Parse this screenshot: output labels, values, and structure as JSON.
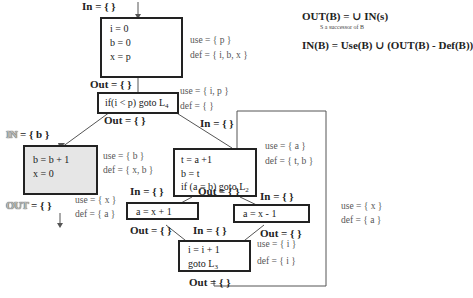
{
  "formulas": {
    "out_def": "OUT(B) = ∪ IN(s)",
    "out_sub": "S a successor of B",
    "in_def": "IN(B) = Use(B) ∪ (OUT(B) - Def(B))"
  },
  "blocks": [
    {
      "id": "B1",
      "lines": [
        "i = 0",
        "b = 0",
        "x = p"
      ],
      "in": "In = { }",
      "out": "Out = { }",
      "use": "use = { p }",
      "def": "def = { i, b, x }"
    },
    {
      "id": "B2",
      "line_prefix": "if(i < p) goto L",
      "line_sub": "4",
      "out_top": "Out = { }",
      "use": "use = { i, p }",
      "def": "def = { }"
    },
    {
      "id": "B3",
      "lines": [
        "b = b + 1",
        "x = 0"
      ],
      "in_label_hl": "IN",
      "in_value": "= { b }",
      "out_label_hl": "OUT",
      "out_value": "= { }",
      "use": "use = { b }",
      "def": "def = { x, b }",
      "out_of_b2": "Out = { }"
    },
    {
      "id": "B4",
      "lines": [
        "t = a +1",
        "b = t"
      ],
      "line3_prefix": "if (a = b) goto L",
      "line3_sub": "2",
      "in": "In = { }",
      "use": "use = { a }",
      "def": "def = { t, b }"
    },
    {
      "id": "B5",
      "lines": [
        "a = x + 1"
      ],
      "in": "In = { }",
      "out": "Out = { }",
      "use": "use = { x }",
      "def": "def = { a }"
    },
    {
      "id": "B6",
      "lines": [
        "a = x - 1"
      ],
      "in": "In = { }",
      "out": "Out = { }",
      "out_of_b4": "Out = { }",
      "use": "use = { x }",
      "def": "def = { a }"
    },
    {
      "id": "B7",
      "lines": [
        "i = i + 1"
      ],
      "line2_prefix": "goto L",
      "line2_sub": "3",
      "in": "In = { }",
      "out": "Out = { }",
      "use": "use = { i }",
      "def": "def = { i }"
    }
  ]
}
